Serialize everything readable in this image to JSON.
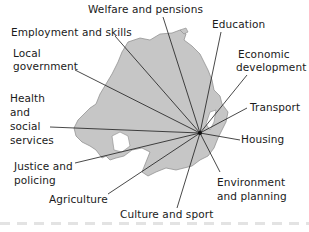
{
  "diagram": {
    "hub": {
      "x": 200,
      "y": 133
    },
    "colors": {
      "land": "#c6c6c6",
      "land_stroke": "#7a7a7a",
      "lines": "#1a1a1a",
      "text": "#1a1a1a",
      "footer_dash": "#e3e3e3"
    },
    "labels": [
      {
        "id": "welfare",
        "text": "Welfare and pensions",
        "x": 88,
        "y": 3
      },
      {
        "id": "employment",
        "text": "Employment and skills",
        "x": 11,
        "y": 26
      },
      {
        "id": "education",
        "text": "Education",
        "x": 212,
        "y": 18
      },
      {
        "id": "local-gov-1",
        "text": "Local",
        "x": 13,
        "y": 47
      },
      {
        "id": "local-gov-2",
        "text": "government",
        "x": 13,
        "y": 60
      },
      {
        "id": "economic-1",
        "text": "Economic",
        "x": 238,
        "y": 48
      },
      {
        "id": "economic-2",
        "text": "development",
        "x": 236,
        "y": 61
      },
      {
        "id": "health-1",
        "text": "Health",
        "x": 10,
        "y": 92
      },
      {
        "id": "health-2",
        "text": "and",
        "x": 10,
        "y": 106
      },
      {
        "id": "health-3",
        "text": "social",
        "x": 10,
        "y": 120
      },
      {
        "id": "health-4",
        "text": "services",
        "x": 10,
        "y": 134
      },
      {
        "id": "transport",
        "text": "Transport",
        "x": 250,
        "y": 101
      },
      {
        "id": "housing",
        "text": "Housing",
        "x": 241,
        "y": 133
      },
      {
        "id": "justice-1",
        "text": "Justice and",
        "x": 14,
        "y": 160
      },
      {
        "id": "justice-2",
        "text": "policing",
        "x": 14,
        "y": 174
      },
      {
        "id": "environment-1",
        "text": "Environment",
        "x": 217,
        "y": 176
      },
      {
        "id": "environment-2",
        "text": "and planning",
        "x": 217,
        "y": 190
      },
      {
        "id": "agriculture",
        "text": "Agriculture",
        "x": 49,
        "y": 193
      },
      {
        "id": "culture",
        "text": "Culture and sport",
        "x": 120,
        "y": 208
      }
    ],
    "spokes": [
      {
        "to": "welfare",
        "x": 163,
        "y": 17
      },
      {
        "to": "employment",
        "x": 115,
        "y": 36
      },
      {
        "to": "education",
        "x": 221,
        "y": 32
      },
      {
        "to": "local-gov",
        "x": 75,
        "y": 70
      },
      {
        "to": "economic",
        "x": 247,
        "y": 75
      },
      {
        "to": "health",
        "x": 50,
        "y": 127
      },
      {
        "to": "transport",
        "x": 247,
        "y": 108
      },
      {
        "to": "housing",
        "x": 240,
        "y": 140
      },
      {
        "to": "justice",
        "x": 75,
        "y": 163
      },
      {
        "to": "environment",
        "x": 220,
        "y": 172
      },
      {
        "to": "agriculture",
        "x": 108,
        "y": 194
      },
      {
        "to": "culture",
        "x": 177,
        "y": 208
      }
    ]
  }
}
